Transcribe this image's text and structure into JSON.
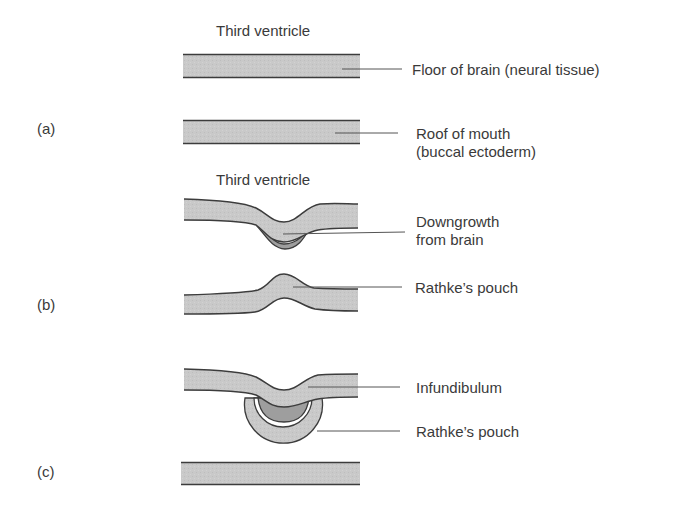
{
  "colors": {
    "tissue_fill": "#c8c8c8",
    "downgrowth_fill": "#9e9e9e",
    "outline": "#3c3c3c",
    "leader": "#555555",
    "background": "#ffffff"
  },
  "panels": [
    {
      "id": "a",
      "label": "(a)",
      "top_caption": "Third ventricle",
      "labels": [
        {
          "text": "Floor of brain (neural tissue)"
        },
        {
          "line1": "Roof of mouth",
          "line2": "(buccal ectoderm)"
        }
      ]
    },
    {
      "id": "b",
      "label": "(b)",
      "top_caption": "Third ventricle",
      "labels": [
        {
          "line1": "Downgrowth",
          "line2": "from brain"
        },
        {
          "text": "Rathke’s pouch"
        }
      ]
    },
    {
      "id": "c",
      "label": "(c)",
      "labels": [
        {
          "text": "Infundibulum"
        },
        {
          "text": "Rathke’s pouch"
        }
      ]
    }
  ]
}
